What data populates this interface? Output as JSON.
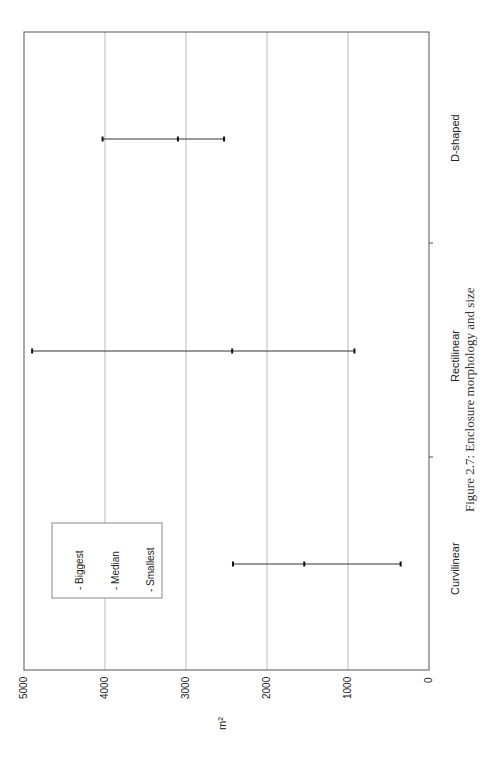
{
  "chart_data": {
    "type": "error-bar (high-median-low)",
    "orientation": "page rotated 90° counter-clockwise; value axis horizontal along bottom",
    "title": "",
    "caption": "Figure 2.7: Enclosure morphology and size",
    "xlabel": "",
    "ylabel": "m²",
    "ylim": [
      0,
      5000
    ],
    "yticks": [
      0,
      1000,
      2000,
      3000,
      4000,
      5000
    ],
    "grid": true,
    "legend_position": "upper-left (inside plot)",
    "categories": [
      "Curvilinear",
      "Rectilinear",
      "D-shaped"
    ],
    "series": [
      {
        "name": "Biggest",
        "values": [
          2420,
          4900,
          4030
        ]
      },
      {
        "name": "Median",
        "values": [
          1540,
          2430,
          3100
        ]
      },
      {
        "name": "Smallest",
        "values": [
          350,
          920,
          2530
        ]
      }
    ]
  },
  "legend": {
    "items": [
      {
        "label": "- Biggest"
      },
      {
        "label": "- Median"
      },
      {
        "label": "- Smallest"
      }
    ]
  },
  "axis": {
    "y_label": "m²",
    "tick_labels": [
      "0",
      "1000",
      "2000",
      "3000",
      "4000",
      "5000"
    ]
  },
  "caption": "Figure 2.7: Enclosure morphology and size",
  "colors": {
    "frame": "#555555",
    "grid": "#bbbbbb",
    "bar": "#333333"
  }
}
